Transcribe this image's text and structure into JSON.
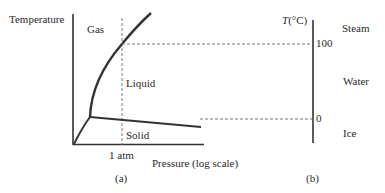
{
  "figure_a": {
    "y_axis_label": "Temperature",
    "x_axis_label": "Pressure (log scale)",
    "x_tick_label": "1 atm",
    "regions": {
      "gas": "Gas",
      "liquid": "Liquid",
      "solid": "Solid"
    },
    "caption": "(a)"
  },
  "figure_b": {
    "axis_label_italic": "T",
    "axis_label_unit": "(°C)",
    "ticks": [
      {
        "label": "100"
      },
      {
        "label": "0"
      }
    ],
    "phases": {
      "steam": "Steam",
      "water": "Water",
      "ice": "Ice"
    },
    "caption": "(b)"
  },
  "colors": {
    "line": "#333333",
    "dash": "#777777",
    "text": "#2a2a2a"
  }
}
